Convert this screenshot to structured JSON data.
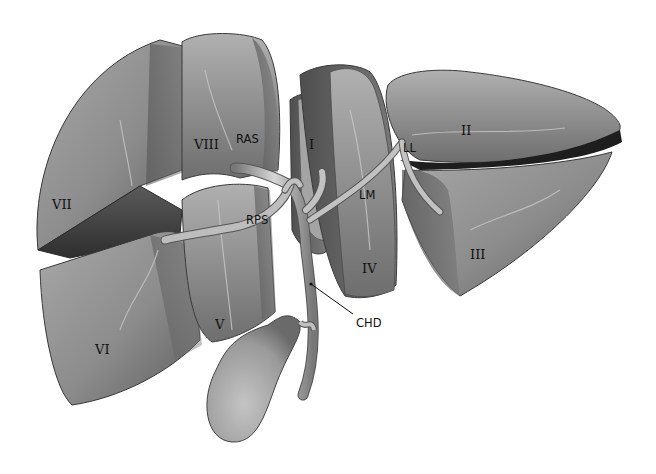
{
  "figure": {
    "type": "anatomical-illustration",
    "background": "#ffffff",
    "tissue_color": "#8a8a8a",
    "outline_color": "#3a3a3a"
  },
  "segment_labels": [
    {
      "id": "seg-1",
      "text": "I",
      "x": 309,
      "y": 138
    },
    {
      "id": "seg-2",
      "text": "II",
      "x": 461,
      "y": 124
    },
    {
      "id": "seg-3",
      "text": "III",
      "x": 470,
      "y": 248
    },
    {
      "id": "seg-4",
      "text": "IV",
      "x": 362,
      "y": 262
    },
    {
      "id": "seg-5",
      "text": "V",
      "x": 215,
      "y": 318
    },
    {
      "id": "seg-6",
      "text": "VI",
      "x": 95,
      "y": 343
    },
    {
      "id": "seg-7",
      "text": "VII",
      "x": 52,
      "y": 198
    },
    {
      "id": "seg-8",
      "text": "VIII",
      "x": 194,
      "y": 138
    }
  ],
  "duct_labels": [
    {
      "id": "ras",
      "text": "RAS",
      "x": 236,
      "y": 134
    },
    {
      "id": "rps",
      "text": "RPS",
      "x": 246,
      "y": 215
    },
    {
      "id": "lm",
      "text": "LM",
      "x": 359,
      "y": 190
    },
    {
      "id": "ll",
      "text": "LL",
      "x": 403,
      "y": 143
    },
    {
      "id": "chd",
      "text": "CHD",
      "x": 356,
      "y": 318
    }
  ],
  "pointer": {
    "from": [
      353,
      314
    ],
    "to": [
      311,
      284
    ]
  }
}
